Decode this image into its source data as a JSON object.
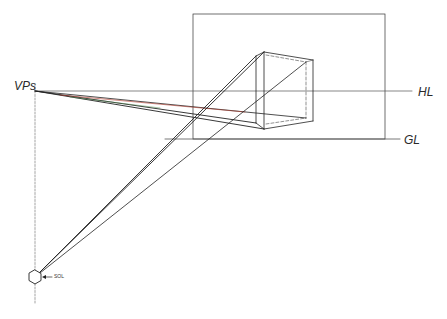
{
  "labels": {
    "vanishing_point": "VPs",
    "horizon_line": "HL",
    "ground_line": "GL",
    "station_point": "SOL"
  },
  "colors": {
    "ink": "#222222",
    "light_ink": "#555555",
    "red_accent": "#b03a2e",
    "green_accent": "#4e8a4e"
  },
  "geometry": {
    "picture_plane": {
      "x1": 193,
      "y1": 14,
      "x2": 385,
      "y2": 139
    },
    "horizon_line_y": 91,
    "ground_line_y": 139,
    "vertical_axis_x": 35,
    "vanishing_point": {
      "x": 35,
      "y": 91
    },
    "station_point": {
      "x": 35,
      "y": 277
    },
    "cube": {
      "front_top": {
        "x": 264,
        "y": 52
      },
      "front_bottom": {
        "x": 264,
        "y": 129
      },
      "left_top": {
        "x": 256,
        "y": 56
      },
      "left_bottom": {
        "x": 256,
        "y": 123
      },
      "right_top": {
        "x": 313,
        "y": 60
      },
      "right_bottom": {
        "x": 313,
        "y": 121
      },
      "back_top": {
        "x": 306,
        "y": 62
      },
      "back_bottom": {
        "x": 306,
        "y": 118
      }
    },
    "convergence_point": {
      "x": 196,
      "y": 117
    }
  }
}
